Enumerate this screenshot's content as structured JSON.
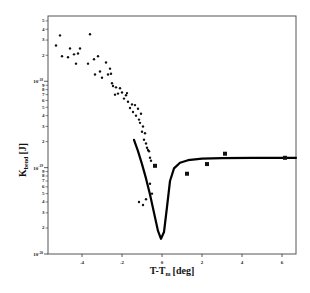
{
  "chart_data": {
    "type": "scatter",
    "title": "",
    "xlabel": "T-T_m [deg]",
    "xlabel_main": "T-T",
    "xlabel_sub": "m",
    "xlabel_unit": "[deg]",
    "ylabel": "K_bend [J]",
    "ylabel_main": "K",
    "ylabel_sub": "bend",
    "ylabel_unit": "[J]",
    "yscale": "log",
    "xlim": [
      -5.7,
      6.7
    ],
    "ylim": [
      1e-20,
      5.7e-18
    ],
    "grid": false,
    "legend": null,
    "x_ticks": [
      -4,
      -2,
      0,
      2,
      4,
      6
    ],
    "x_tick_labels": [
      "-4",
      "-2",
      "0",
      "2",
      "4",
      "6"
    ],
    "y_decade_ticks": [
      {
        "value": 1e-18,
        "label_base": "10",
        "label_exp": "-18"
      },
      {
        "value": 1e-19,
        "label_base": "10",
        "label_exp": "-19"
      },
      {
        "value": 1e-20,
        "label_base": "10",
        "label_exp": "-20"
      }
    ],
    "y_minor_labels": [
      "2",
      "3",
      "4",
      "5",
      "6",
      "7",
      "8",
      "9"
    ],
    "series": [
      {
        "name": "dots (small scatter)",
        "marker": "dot",
        "points": [
          [
            -5.3,
            2.6e-18
          ],
          [
            -5.1,
            3.4e-18
          ],
          [
            -5.0,
            1.95e-18
          ],
          [
            -4.7,
            1.9e-18
          ],
          [
            -4.6,
            2.4e-18
          ],
          [
            -4.4,
            2.05e-18
          ],
          [
            -4.3,
            1.6e-18
          ],
          [
            -4.2,
            2.1e-18
          ],
          [
            -4.1,
            2.4e-18
          ],
          [
            -3.7,
            1.6e-18
          ],
          [
            -3.6,
            3.5e-18
          ],
          [
            -3.4,
            1.8e-18
          ],
          [
            -3.35,
            1.2e-18
          ],
          [
            -3.2,
            1.95e-18
          ],
          [
            -3.1,
            1.3e-18
          ],
          [
            -3.0,
            1.1e-18
          ],
          [
            -2.8,
            1.65e-18
          ],
          [
            -2.7,
            1.2e-18
          ],
          [
            -2.6,
            1.4e-18
          ],
          [
            -2.55,
            1.22e-18
          ],
          [
            -2.5,
            9.5e-19
          ],
          [
            -2.45,
            8.8e-19
          ],
          [
            -2.35,
            7e-19
          ],
          [
            -2.3,
            8.5e-19
          ],
          [
            -2.2,
            7.2e-19
          ],
          [
            -2.1,
            8.3e-19
          ],
          [
            -2.0,
            7.4e-19
          ],
          [
            -1.9,
            6.3e-19
          ],
          [
            -1.8,
            6.9e-19
          ],
          [
            -1.75,
            7.3e-19
          ],
          [
            -1.7,
            5.8e-19
          ],
          [
            -1.6,
            4.9e-19
          ],
          [
            -1.5,
            5.4e-19
          ],
          [
            -1.45,
            4.4e-19
          ],
          [
            -1.35,
            5.3e-19
          ],
          [
            -1.3,
            4e-19
          ],
          [
            -1.2,
            4.8e-19
          ],
          [
            -1.15,
            3.6e-19
          ],
          [
            -1.1,
            3.3e-19
          ],
          [
            -1.05,
            4.2e-19
          ],
          [
            -1.0,
            2.6e-19
          ],
          [
            -0.95,
            3e-19
          ],
          [
            -0.9,
            2.1e-19
          ],
          [
            -0.85,
            2.5e-19
          ],
          [
            -0.8,
            1.9e-19
          ],
          [
            -0.75,
            1.7e-19
          ],
          [
            -0.7,
            1.6e-19
          ],
          [
            -0.65,
            1.55e-19
          ],
          [
            -0.6,
            1.3e-19
          ],
          [
            -0.55,
            1.2e-19
          ],
          [
            -1.15,
            4e-20
          ],
          [
            -0.95,
            3.7e-20
          ],
          [
            -0.8,
            4.3e-20
          ],
          [
            -0.6,
            6.5e-20
          ],
          [
            -0.5,
            5e-20
          ]
        ]
      },
      {
        "name": "squares",
        "marker": "square",
        "points": [
          [
            -0.35,
            1.05e-19
          ],
          [
            1.25,
            8.5e-20
          ],
          [
            2.25,
            1.1e-19
          ],
          [
            3.15,
            1.45e-19
          ],
          [
            6.15,
            1.3e-19
          ]
        ]
      },
      {
        "name": "fit curve",
        "marker": "line",
        "points": [
          [
            -1.4,
            2.1e-19
          ],
          [
            -1.2,
            1.55e-19
          ],
          [
            -1.0,
            1.1e-19
          ],
          [
            -0.8,
            7.5e-20
          ],
          [
            -0.6,
            4.9e-20
          ],
          [
            -0.4,
            3e-20
          ],
          [
            -0.2,
            1.85e-20
          ],
          [
            -0.05,
            1.5e-20
          ],
          [
            0.1,
            1.8e-20
          ],
          [
            0.25,
            3.5e-20
          ],
          [
            0.4,
            7e-20
          ],
          [
            0.6,
            9.8e-20
          ],
          [
            0.9,
            1.14e-19
          ],
          [
            1.3,
            1.22e-19
          ],
          [
            2.0,
            1.27e-19
          ],
          [
            3.0,
            1.29e-19
          ],
          [
            4.5,
            1.3e-19
          ],
          [
            6.7,
            1.3e-19
          ]
        ]
      }
    ]
  }
}
